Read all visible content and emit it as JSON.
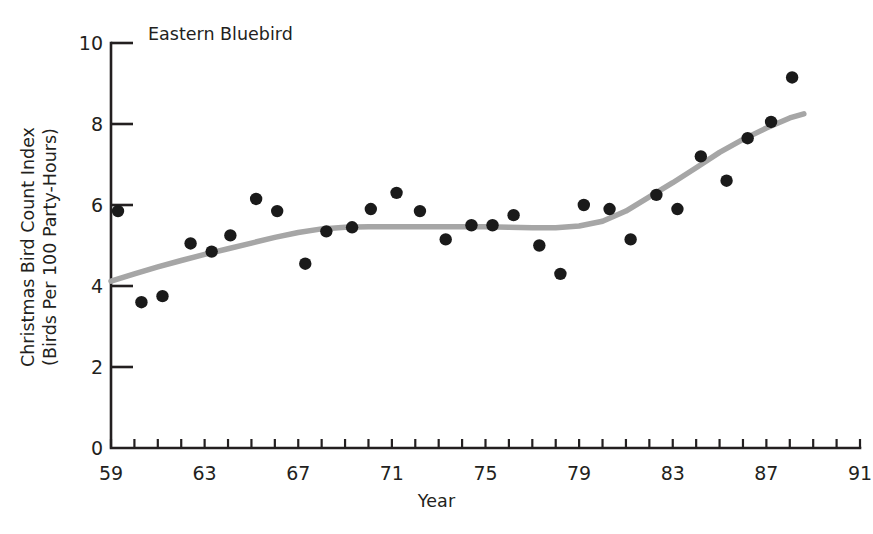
{
  "chart_data": {
    "type": "scatter",
    "title": "Eastern Bluebird",
    "xlabel": "Year",
    "ylabel": "Christmas Bird Count Index (Birds Per 100 Party-Hours)",
    "ylabel_line1": "Christmas Bird Count Index",
    "ylabel_line2": "(Birds Per 100 Party-Hours)",
    "xlim": [
      59,
      91
    ],
    "ylim": [
      0,
      10
    ],
    "grid": false,
    "legend": "none",
    "xticklabels": [
      "59",
      "63",
      "67",
      "71",
      "75",
      "79",
      "83",
      "87",
      "91"
    ],
    "xtickvalues": [
      59,
      63,
      67,
      71,
      75,
      79,
      83,
      87,
      91
    ],
    "xminorticks": [
      59,
      60,
      61,
      62,
      63,
      64,
      65,
      66,
      67,
      68,
      69,
      70,
      71,
      72,
      73,
      74,
      75,
      76,
      77,
      78,
      79,
      80,
      81,
      82,
      83,
      84,
      85,
      86,
      87,
      88,
      89,
      90,
      91
    ],
    "yticklabels": [
      "0",
      "2",
      "4",
      "6",
      "8",
      "10"
    ],
    "ytickvalues": [
      0,
      2,
      4,
      6,
      8,
      10
    ],
    "marker_color": "#1a1a1a",
    "trend_color": "#a6a6a6",
    "axis_color": "#231f20",
    "background_color": "#ffffff",
    "series": [
      {
        "name": "Eastern Bluebird Christmas Bird Count Index",
        "marker": "filled-circle",
        "x": [
          59.3,
          60.3,
          61.2,
          62.4,
          63.3,
          64.1,
          65.2,
          66.1,
          67.3,
          68.2,
          69.3,
          70.1,
          71.2,
          72.2,
          73.3,
          74.4,
          75.3,
          76.2,
          77.3,
          78.2,
          79.2,
          80.3,
          81.2,
          82.3,
          83.2,
          84.2,
          85.3,
          86.2,
          87.2,
          88.1
        ],
        "y": [
          5.85,
          3.6,
          3.75,
          5.05,
          4.85,
          5.25,
          6.15,
          5.85,
          4.55,
          5.35,
          5.45,
          5.9,
          6.3,
          5.85,
          5.15,
          5.5,
          5.5,
          5.75,
          5.0,
          4.3,
          6.0,
          5.9,
          5.15,
          6.25,
          5.9,
          7.2,
          6.6,
          7.65,
          8.05,
          9.15
        ]
      }
    ],
    "trend": {
      "name": "smoothed trend",
      "x": [
        59.0,
        60.0,
        61.0,
        62.0,
        63.0,
        64.0,
        65.0,
        66.0,
        67.0,
        68.0,
        69.0,
        70.0,
        71.0,
        72.0,
        73.0,
        74.0,
        75.0,
        76.0,
        77.0,
        78.0,
        79.0,
        80.0,
        81.0,
        82.0,
        83.0,
        84.0,
        85.0,
        86.0,
        87.0,
        88.0,
        88.6
      ],
      "y": [
        4.12,
        4.3,
        4.47,
        4.63,
        4.78,
        4.92,
        5.06,
        5.2,
        5.32,
        5.41,
        5.45,
        5.46,
        5.46,
        5.46,
        5.46,
        5.46,
        5.46,
        5.45,
        5.44,
        5.44,
        5.48,
        5.6,
        5.85,
        6.2,
        6.55,
        6.92,
        7.3,
        7.62,
        7.9,
        8.15,
        8.25
      ]
    }
  }
}
